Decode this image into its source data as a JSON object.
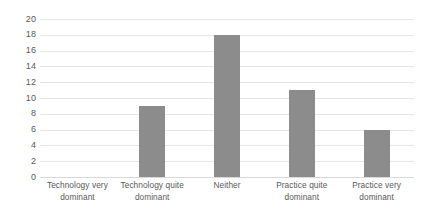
{
  "chart_data": {
    "type": "bar",
    "title": "",
    "subtitle": "",
    "xlabel": "",
    "ylabel": "",
    "categories": [
      "Technology very dominant",
      "Technology quite dominant",
      "Neither",
      "Practice quite dominant",
      "Practice very dominant"
    ],
    "values": [
      0,
      9,
      18,
      11,
      6
    ],
    "ylim": [
      0,
      20
    ],
    "ytick_step": 2,
    "ytick_labels": [
      "0",
      "2",
      "4",
      "6",
      "8",
      "10",
      "12",
      "14",
      "16",
      "18",
      "20"
    ],
    "ytick_values": [
      0,
      2,
      4,
      6,
      8,
      10,
      12,
      14,
      16,
      18,
      20
    ],
    "grid": "horizontal",
    "legend": "none",
    "bar_color": "#8c8c8c",
    "gridline_color": "#e6e6e6",
    "axis_text_color": "#595959",
    "background_color": "#ffffff",
    "data_labels": "none"
  }
}
